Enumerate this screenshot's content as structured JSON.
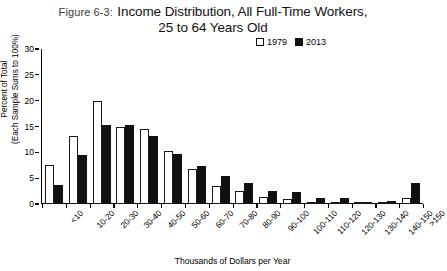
{
  "figure": {
    "number_label": "Figure 6-3:",
    "title_line1": "Income Distribution, All Full-Time Workers,",
    "title_line2": "25 to 64 Years Old"
  },
  "legend": {
    "position": "top-right",
    "items": [
      {
        "label": "1979",
        "swatch": "white-square",
        "color": "#ffffff"
      },
      {
        "label": "2013",
        "swatch": "black-square",
        "color": "#111111"
      }
    ]
  },
  "axes": {
    "y_title_line1": "Percent of Total",
    "y_title_line2": "(Each Sample Sums to 100%)",
    "x_title": "Thousands of Dollars per Year",
    "y_ticks": [
      "0",
      "5",
      "10",
      "15",
      "20",
      "25",
      "30"
    ]
  },
  "chart_data": {
    "type": "bar",
    "title": "Figure 6-3: Income Distribution, All Full-Time Workers, 25 to 64 Years Old",
    "xlabel": "Thousands of Dollars per Year",
    "ylabel": "Percent of Total (Each Sample Sums to 100%)",
    "ylim": [
      0,
      30
    ],
    "ytick_step": 5,
    "grid": false,
    "legend_position": "top-right",
    "categories": [
      "<10",
      "10-20",
      "20-30",
      "30-40",
      "40-50",
      "50-60",
      "60-70",
      "70-80",
      "80-90",
      "90-100",
      "100-110",
      "110-120",
      "120-130",
      "130-140",
      "140-150",
      ">150"
    ],
    "series": [
      {
        "name": "1979",
        "color": "#ffffff",
        "values": [
          7.6,
          13.1,
          20.0,
          15.0,
          14.6,
          10.3,
          6.8,
          3.4,
          2.6,
          1.4,
          1.0,
          0.3,
          0.2,
          0.3,
          0.2,
          1.2
        ]
      },
      {
        "name": "2013",
        "color": "#111111",
        "values": [
          3.7,
          9.4,
          15.2,
          15.3,
          13.1,
          9.6,
          7.3,
          5.4,
          4.0,
          2.6,
          2.4,
          1.2,
          1.1,
          0.4,
          0.5,
          4.0
        ]
      }
    ]
  }
}
